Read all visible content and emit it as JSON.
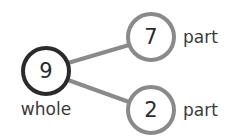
{
  "diagram": {
    "type": "number-bond",
    "background_color": "#ffffff",
    "whole": {
      "value": "9",
      "label": "whole",
      "stroke_color": "#2b2b2b",
      "stroke_width": 4,
      "cx": 46,
      "cy": 71,
      "r": 23
    },
    "parts": [
      {
        "value": "7",
        "label": "part",
        "stroke_color": "#8a8a8a",
        "stroke_width": 4,
        "cx": 151,
        "cy": 37,
        "r": 23,
        "label_x": 183,
        "label_y": 37
      },
      {
        "value": "2",
        "label": "part",
        "stroke_color": "#8a8a8a",
        "stroke_width": 4,
        "cx": 151,
        "cy": 110,
        "r": 23,
        "label_x": 183,
        "label_y": 110
      }
    ],
    "connectors": [
      {
        "name": "whole-to-part-7",
        "x1": 68,
        "y1": 63,
        "x2": 129,
        "y2": 45,
        "color": "#8a8a8a",
        "width": 4
      },
      {
        "name": "whole-to-part-2",
        "x1": 68,
        "y1": 80,
        "x2": 129,
        "y2": 102,
        "color": "#8a8a8a",
        "width": 4
      }
    ]
  }
}
